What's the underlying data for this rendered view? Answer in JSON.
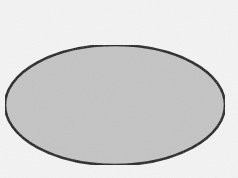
{
  "diagram": {
    "shapes": [
      {
        "type": "ellipse",
        "cx": 115,
        "cy": 105,
        "rx": 110,
        "ry": 60,
        "fill": "#c4c4c4",
        "stroke": "#1a1a1a",
        "stroke_width": 2.5
      }
    ],
    "background": "#f4f4f4"
  }
}
